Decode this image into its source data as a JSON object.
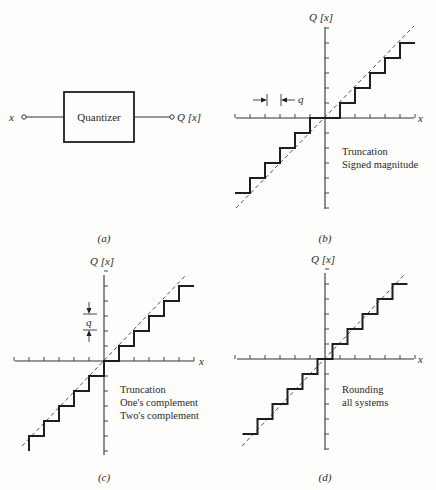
{
  "panel_a": {
    "block_label": "Quantizer",
    "input_label": "x",
    "output_label": "Q [x]",
    "caption": "(a)"
  },
  "panel_b": {
    "y_label": "Q [x]",
    "x_label": "x",
    "step_label": "q",
    "annotation": [
      "Truncation",
      "Signed magnitude"
    ],
    "caption": "(b)",
    "mode": "truncation-signed-magnitude"
  },
  "panel_c": {
    "y_label": "Q [x]",
    "x_label": "x",
    "step_label": "q",
    "annotation": [
      "Truncation",
      "One's complement",
      "Two's complement"
    ],
    "caption": "(c)",
    "mode": "truncation-twos-complement"
  },
  "panel_d": {
    "y_label": "Q [x]",
    "x_label": "x",
    "annotation": [
      "Rounding",
      "all systems"
    ],
    "caption": "(d)",
    "mode": "rounding"
  }
}
